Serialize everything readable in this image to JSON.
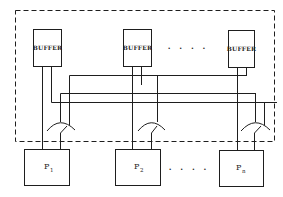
{
  "diagram": {
    "type": "shared-buffer multiprocessor interconnect",
    "boundary": {
      "style": "dashed",
      "label": ""
    },
    "buffers": [
      {
        "label": "BUFFER"
      },
      {
        "label": "BUFFER"
      },
      {
        "label": "BUFFER"
      }
    ],
    "buffer_ellipsis": ". . . .",
    "processors": [
      {
        "label": "P",
        "subscript": "1"
      },
      {
        "label": "P",
        "subscript": "2"
      },
      {
        "label": "P",
        "subscript": "n"
      }
    ],
    "processor_ellipsis": ". . . .",
    "switches": [
      {
        "name": "switch-1"
      },
      {
        "name": "switch-2"
      },
      {
        "name": "switch-n"
      }
    ],
    "colors": {
      "stroke": "#1e1e1e",
      "background": "#ffffff"
    }
  }
}
